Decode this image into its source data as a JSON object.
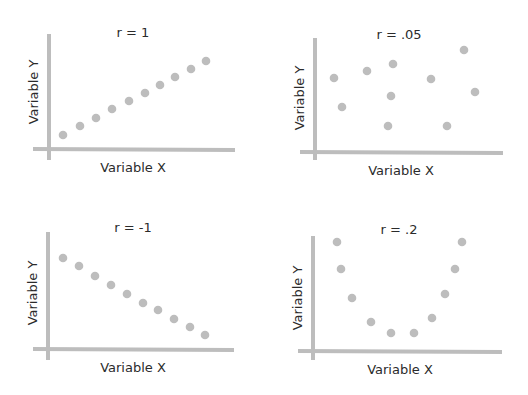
{
  "colors": {
    "axis": "#bdbdbd",
    "dot": "#bdbdbd",
    "text": "#2b2b2b",
    "background": "#ffffff"
  },
  "chart_data": [
    {
      "type": "scatter",
      "title": "r = 1",
      "xlabel": "Variable X",
      "ylabel": "Variable Y",
      "grid": false,
      "frame": {
        "axis_x": 49,
        "axis_y": 149,
        "x_start": 33,
        "x_end": 235,
        "y_start": 34,
        "y_end": 160,
        "title_x": 133,
        "title_y": 37,
        "xlabel_x": 133,
        "xlabel_y": 172,
        "ylabel_x": 38,
        "ylabel_y": 92
      },
      "points": [
        [
          63,
          135
        ],
        [
          80,
          126
        ],
        [
          96,
          118
        ],
        [
          112,
          109
        ],
        [
          129,
          101
        ],
        [
          145,
          93
        ],
        [
          160,
          85
        ],
        [
          175,
          77
        ],
        [
          191,
          69
        ],
        [
          206,
          61
        ]
      ]
    },
    {
      "type": "scatter",
      "title": "r = .05",
      "xlabel": "Variable X",
      "ylabel": "Variable Y",
      "grid": false,
      "frame": {
        "axis_x": 315,
        "axis_y": 152,
        "x_start": 300,
        "x_end": 503,
        "y_start": 38,
        "y_end": 160,
        "title_x": 399,
        "title_y": 39,
        "xlabel_x": 401,
        "xlabel_y": 175,
        "ylabel_x": 304,
        "ylabel_y": 98
      },
      "points": [
        [
          334,
          78
        ],
        [
          342,
          107
        ],
        [
          367,
          71
        ],
        [
          393,
          64
        ],
        [
          391,
          96
        ],
        [
          388,
          126
        ],
        [
          431,
          79
        ],
        [
          447,
          126
        ],
        [
          464,
          50
        ],
        [
          475,
          92
        ]
      ]
    },
    {
      "type": "scatter",
      "title": "r = -1",
      "xlabel": "Variable X",
      "ylabel": "Variable Y",
      "grid": false,
      "frame": {
        "axis_x": 48,
        "axis_y": 349,
        "x_start": 33,
        "x_end": 234,
        "y_start": 232,
        "y_end": 360,
        "title_x": 133,
        "title_y": 232,
        "xlabel_x": 133,
        "xlabel_y": 372,
        "ylabel_x": 37,
        "ylabel_y": 293
      },
      "points": [
        [
          63,
          258
        ],
        [
          79,
          266
        ],
        [
          95,
          276
        ],
        [
          111,
          285
        ],
        [
          127,
          294
        ],
        [
          143,
          303
        ],
        [
          158,
          310
        ],
        [
          174,
          319
        ],
        [
          190,
          327
        ],
        [
          205,
          335
        ]
      ]
    },
    {
      "type": "scatter",
      "title": "r = .2",
      "xlabel": "Variable X",
      "ylabel": "Variable Y",
      "grid": false,
      "frame": {
        "axis_x": 313,
        "axis_y": 351,
        "x_start": 298,
        "x_end": 502,
        "y_start": 236,
        "y_end": 360,
        "title_x": 399,
        "title_y": 234,
        "xlabel_x": 400,
        "xlabel_y": 374,
        "ylabel_x": 302,
        "ylabel_y": 298
      },
      "points": [
        [
          337,
          242
        ],
        [
          341,
          269
        ],
        [
          352,
          298
        ],
        [
          371,
          322
        ],
        [
          391,
          333
        ],
        [
          414,
          333
        ],
        [
          432,
          318
        ],
        [
          445,
          294
        ],
        [
          455,
          269
        ],
        [
          462,
          242
        ]
      ]
    }
  ]
}
